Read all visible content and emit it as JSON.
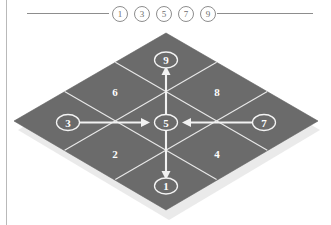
{
  "header": {
    "numbers": [
      "1",
      "3",
      "5",
      "7",
      "9"
    ],
    "rule_color": "#8d8d8d"
  },
  "board": {
    "tile_color": "#6b6b6b",
    "edge_color": "#e9e9e9",
    "arrow_color": "#f2f2f2",
    "label_color": "#ffffff",
    "grid_rows": 3,
    "grid_cols": 3,
    "cells": [
      {
        "id": "cell-6",
        "label": "6",
        "row": 0,
        "col": 0,
        "marked": false
      },
      {
        "id": "cell-9",
        "label": "9",
        "row": 0,
        "col": 1,
        "marked": true
      },
      {
        "id": "cell-8",
        "label": "8",
        "row": 0,
        "col": 2,
        "marked": false
      },
      {
        "id": "cell-3",
        "label": "3",
        "row": 1,
        "col": 0,
        "marked": true
      },
      {
        "id": "cell-5",
        "label": "5",
        "row": 1,
        "col": 1,
        "marked": true
      },
      {
        "id": "cell-7",
        "label": "7",
        "row": 1,
        "col": 2,
        "marked": true
      },
      {
        "id": "cell-2",
        "label": "2",
        "row": 2,
        "col": 0,
        "marked": false
      },
      {
        "id": "cell-1",
        "label": "1",
        "row": 2,
        "col": 1,
        "marked": true
      },
      {
        "id": "cell-4",
        "label": "4",
        "row": 2,
        "col": 2,
        "marked": false
      }
    ],
    "arrows": [
      {
        "id": "arrow-5-to-9",
        "from": "5",
        "to": "9",
        "direction": "up"
      },
      {
        "id": "arrow-5-to-1",
        "from": "5",
        "to": "1",
        "direction": "down"
      },
      {
        "id": "arrow-3-to-5",
        "from": "3",
        "to": "5",
        "direction": "right"
      },
      {
        "id": "arrow-7-to-5",
        "from": "7",
        "to": "5",
        "direction": "left"
      }
    ]
  }
}
